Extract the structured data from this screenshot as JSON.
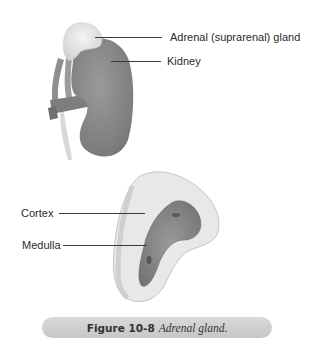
{
  "figure": {
    "top_illustration": {
      "labels": [
        {
          "id": "adrenal",
          "text": "Adrenal (suprarenal) gland"
        },
        {
          "id": "kidney",
          "text": "Kidney"
        }
      ]
    },
    "bottom_illustration": {
      "labels": [
        {
          "id": "cortex",
          "text": "Cortex"
        },
        {
          "id": "medulla",
          "text": "Medulla"
        }
      ]
    },
    "caption": {
      "number": "Figure 10-8",
      "text": "Adrenal gland."
    },
    "colors": {
      "kidney": "#8c8c8c",
      "adrenal": "#e6e6e6",
      "cortex": "#e4e4e4",
      "medulla": "#8a8a8a",
      "caption_bg": "#cfcfcf"
    }
  }
}
